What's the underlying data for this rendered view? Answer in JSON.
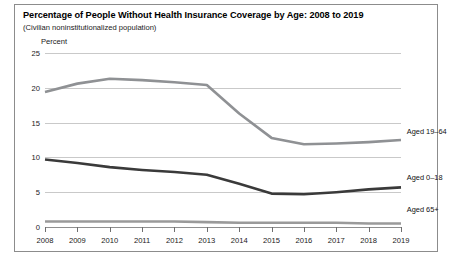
{
  "figure": {
    "title": "Percentage of People Without Health Insurance Coverage by Age: 2008 to 2019",
    "subtitle": "(Civilian noninstitutionalized population)",
    "axis_note": "Percent"
  },
  "chart_data": {
    "type": "line",
    "title": "Percentage of People Without Health Insurance Coverage by Age: 2008 to 2019",
    "subtitle": "(Civilian noninstitutionalized population)",
    "xlabel": "",
    "ylabel": "Percent",
    "x": [
      2008,
      2009,
      2010,
      2011,
      2012,
      2013,
      2014,
      2015,
      2016,
      2017,
      2018,
      2019
    ],
    "categories": [
      "2008",
      "2009",
      "2010",
      "2011",
      "2012",
      "2013",
      "2014",
      "2015",
      "2016",
      "2017",
      "2018",
      "2019"
    ],
    "ylim": [
      0,
      25
    ],
    "yticks": [
      0,
      5,
      10,
      15,
      20,
      25
    ],
    "ytick_labels": [
      "0",
      "5",
      "10",
      "15",
      "20",
      "25"
    ],
    "grid": true,
    "legend_position": "right-inline",
    "series": [
      {
        "name": "Aged 19-64",
        "label": "Aged 19–64",
        "color": "#8f9194",
        "width": 2.6,
        "values": [
          19.4,
          20.6,
          21.3,
          21.1,
          20.8,
          20.4,
          16.3,
          12.8,
          11.9,
          12.0,
          12.2,
          12.5
        ]
      },
      {
        "name": "Aged 0-18",
        "label": "Aged 0–18",
        "color": "#3a3a3a",
        "width": 2.6,
        "values": [
          9.7,
          9.2,
          8.6,
          8.2,
          7.9,
          7.5,
          6.2,
          4.8,
          4.7,
          5.0,
          5.4,
          5.7
        ]
      },
      {
        "name": "Aged 65+",
        "label": "Aged 65+",
        "color": "#9a9a9a",
        "width": 2.6,
        "values": [
          0.8,
          0.8,
          0.8,
          0.8,
          0.8,
          0.7,
          0.6,
          0.6,
          0.6,
          0.6,
          0.5,
          0.5
        ]
      }
    ],
    "series_labels": [
      {
        "text": "Aged 19–64",
        "x_pct": 100.5,
        "y_value": 13.6
      },
      {
        "text": "Aged 0–18",
        "x_pct": 100.5,
        "y_value": 7.1
      },
      {
        "text": "Aged 65+",
        "x_pct": 100.5,
        "y_value": 2.4
      }
    ]
  }
}
